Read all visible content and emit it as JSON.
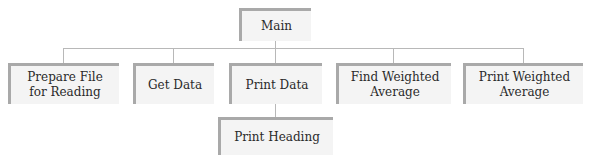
{
  "diagram": {
    "type": "structure-chart",
    "root": {
      "label": "Main"
    },
    "children": [
      {
        "label": "Prepare File\nfor Reading"
      },
      {
        "label": "Get Data"
      },
      {
        "label": "Print Data",
        "children": [
          {
            "label": "Print Heading"
          }
        ]
      },
      {
        "label": "Find Weighted\nAverage"
      },
      {
        "label": "Print Weighted\nAverage"
      }
    ],
    "colors": {
      "box_fill": "#f4f4f4",
      "box_border": "#a9a9a9",
      "connector": "#b8b8b8",
      "text": "#2a2a2a"
    }
  }
}
